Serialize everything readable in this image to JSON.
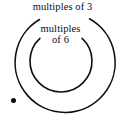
{
  "figure": {
    "kind": "set-diagram",
    "title_visible": false,
    "background_color": "#ffffff",
    "stroke_color": "#101010",
    "dot_color": "#0b0b0b",
    "width": 125,
    "height": 118
  },
  "sets": {
    "outer": {
      "label": "multiples of 3",
      "center_x": 63,
      "center_y": 63,
      "radius": 50,
      "gap_top": true,
      "gap_start_deg": -118,
      "gap_end_deg": -62
    },
    "inner": {
      "label_line1": "multiples",
      "label_line2": "of 6",
      "center_x": 61,
      "center_y": 61,
      "radius": 31,
      "gap_top": true,
      "gap_start_deg": -133,
      "gap_end_deg": -47
    }
  },
  "elements": [
    {
      "name": "point-outside",
      "symbol": "•",
      "label": "",
      "x": 13,
      "y": 100,
      "region": "outside-all-sets"
    }
  ]
}
